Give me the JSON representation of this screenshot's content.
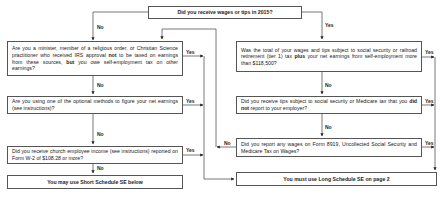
{
  "flowchart": {
    "start": {
      "text": "Did you receive wages or tips in 2015?"
    },
    "left": [
      {
        "parts": [
          "Are you a minister, member of a religious order, or Christian Science practitioner who received IRS approval ",
          "not",
          " to be taxed on earnings from these sources, ",
          "but",
          " you owe self-employment tax on other earnings?"
        ]
      },
      {
        "parts": [
          "Are you using one of the optional methods to figure your net earnings (see instructions)?"
        ]
      },
      {
        "parts": [
          "Did you receive church employee income (see instructions) reported on Form W-2 of $108.28 or more?"
        ]
      },
      {
        "text": "You may use Short Schedule SE below"
      }
    ],
    "right": [
      {
        "parts": [
          "Was the total of your wages and tips subject to social security or railroad retirement (tier 1) tax ",
          "plus",
          " your net earnings from self-employment more than $118,500?"
        ]
      },
      {
        "parts": [
          "Did you receive tips subject to social security or Medicare tax that you ",
          "did not",
          " report to your employer?"
        ]
      },
      {
        "parts": [
          "Did you report any wages on Form 8919, Uncollected Social Security and Medicare Tax on Wages?"
        ]
      },
      {
        "text": "You must use Long Schedule SE on page 2"
      }
    ],
    "labels": {
      "yes": "Yes",
      "no": "No"
    }
  }
}
